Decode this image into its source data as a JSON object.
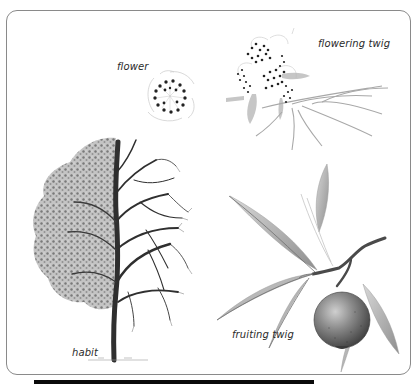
{
  "figure": {
    "labels": {
      "flower": "flower",
      "flowering_twig": "flowering twig",
      "habit": "habit",
      "fruiting_twig": "fruiting twig"
    },
    "panels": [
      {
        "id": "flower",
        "icon": "flower-illustration"
      },
      {
        "id": "flowering_twig",
        "icon": "flowering-twig-illustration"
      },
      {
        "id": "habit",
        "icon": "tree-habit-illustration"
      },
      {
        "id": "fruiting_twig",
        "icon": "fruiting-twig-illustration"
      }
    ],
    "colors": {
      "frame_border": "#8a8a8a",
      "ink": "#2a2a2a",
      "leaf_gray": "#9a9a9a",
      "fruit_gray": "#6e6e6e",
      "bottom_bar": "#0a0a0a"
    }
  }
}
